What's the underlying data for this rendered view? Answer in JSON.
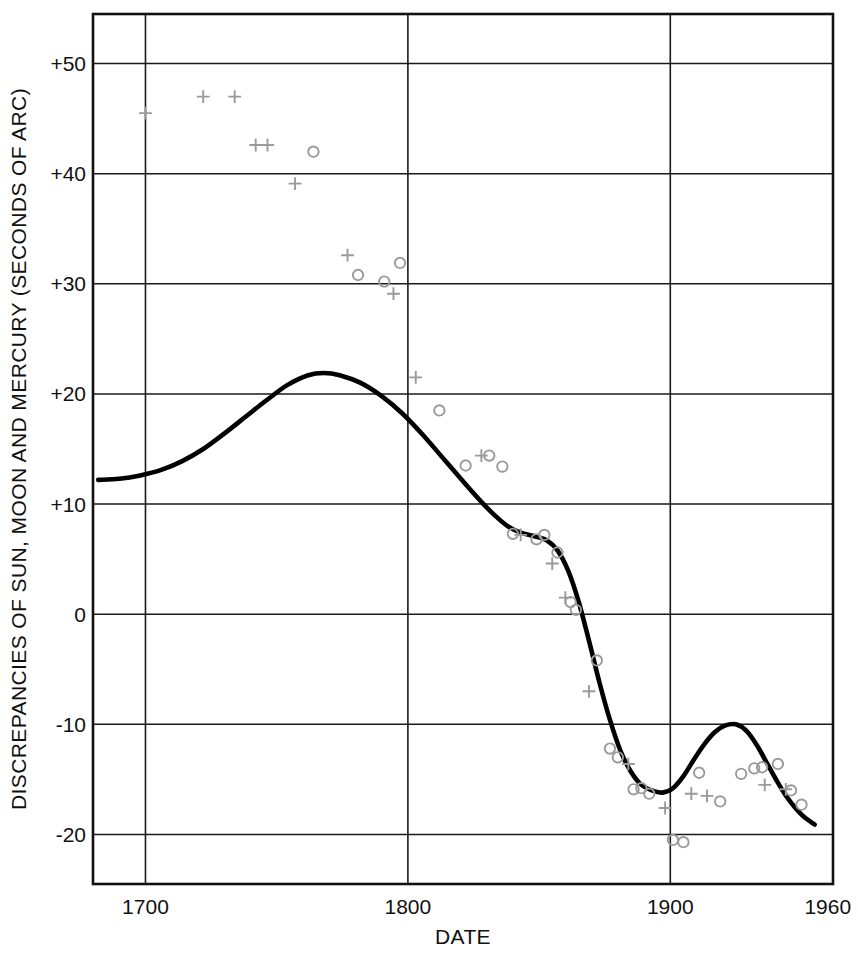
{
  "chart_data": {
    "type": "scatter",
    "title": "",
    "xlabel": "DATE",
    "ylabel": "DISCREPANCIES OF SUN, MOON AND MERCURY (SECONDS OF ARC)",
    "xlim": [
      1680,
      1962
    ],
    "ylim": [
      -24.5,
      54.5
    ],
    "xticks": [
      1700,
      1800,
      1900,
      1960
    ],
    "xticklabels": [
      "1700",
      "1800",
      "1900",
      "1960"
    ],
    "yticks": [
      50,
      40,
      30,
      20,
      10,
      0,
      -10,
      -20
    ],
    "yticklabels": [
      "+50",
      "+40",
      "+30",
      "+20",
      "+10",
      "0",
      "-10",
      "-20"
    ],
    "grid": true,
    "gridlines_x": [
      1700,
      1800,
      1900
    ],
    "gridlines_y": [
      50,
      40,
      30,
      20,
      10,
      0,
      -10,
      -20
    ],
    "legend": "none",
    "marker_color": "#9a9a9a",
    "curve_color": "#000000",
    "series": [
      {
        "name": "plus-markers",
        "marker": "plus",
        "points": [
          [
            1700.0,
            45.5
          ],
          [
            1722.0,
            47.0
          ],
          [
            1734.0,
            47.0
          ],
          [
            1742.0,
            42.6
          ],
          [
            1746.5,
            42.6
          ],
          [
            1757.0,
            39.1
          ],
          [
            1777.0,
            32.6
          ],
          [
            1794.5,
            29.1
          ],
          [
            1803.0,
            21.5
          ],
          [
            1828.0,
            14.4
          ],
          [
            1843.0,
            7.2
          ],
          [
            1855.0,
            4.6
          ],
          [
            1860.0,
            1.5
          ],
          [
            1869.0,
            -7.0
          ],
          [
            1884.0,
            -13.6
          ],
          [
            1898.0,
            -17.6
          ],
          [
            1908.0,
            -16.3
          ],
          [
            1914.0,
            -16.5
          ],
          [
            1936.0,
            -15.5
          ],
          [
            1944.0,
            -15.9
          ]
        ]
      },
      {
        "name": "circle-markers",
        "marker": "circle",
        "points": [
          [
            1764.0,
            42.0
          ],
          [
            1781.0,
            30.8
          ],
          [
            1791.0,
            30.2
          ],
          [
            1797.0,
            31.9
          ],
          [
            1812.0,
            18.5
          ],
          [
            1822.0,
            13.5
          ],
          [
            1831.0,
            14.4
          ],
          [
            1836.0,
            13.4
          ],
          [
            1840.0,
            7.3
          ],
          [
            1849.0,
            6.8
          ],
          [
            1852.0,
            7.2
          ],
          [
            1857.0,
            5.6
          ],
          [
            1862.0,
            1.1
          ],
          [
            1864.0,
            0.4
          ],
          [
            1872.0,
            -4.2
          ],
          [
            1877.0,
            -12.2
          ],
          [
            1880.0,
            -13.0
          ],
          [
            1886.0,
            -15.9
          ],
          [
            1889.0,
            -15.8
          ],
          [
            1892.0,
            -16.3
          ],
          [
            1901.0,
            -20.5
          ],
          [
            1905.0,
            -20.7
          ],
          [
            1911.0,
            -14.4
          ],
          [
            1919.0,
            -17.0
          ],
          [
            1927.0,
            -14.5
          ],
          [
            1932.0,
            -14.0
          ],
          [
            1935.0,
            -13.9
          ],
          [
            1941.0,
            -13.6
          ],
          [
            1946.0,
            -16.0
          ],
          [
            1950.0,
            -17.3
          ]
        ]
      }
    ],
    "fitted_curve": {
      "name": "smoothed-trend-curve",
      "points": [
        [
          1682,
          12.2
        ],
        [
          1690,
          12.3
        ],
        [
          1698,
          12.6
        ],
        [
          1706,
          13.1
        ],
        [
          1714,
          13.9
        ],
        [
          1722,
          15.0
        ],
        [
          1730,
          16.4
        ],
        [
          1738,
          17.9
        ],
        [
          1746,
          19.4
        ],
        [
          1754,
          20.8
        ],
        [
          1762,
          21.7
        ],
        [
          1768,
          21.9
        ],
        [
          1774,
          21.7
        ],
        [
          1782,
          21.0
        ],
        [
          1790,
          19.8
        ],
        [
          1798,
          18.2
        ],
        [
          1806,
          16.2
        ],
        [
          1814,
          14.0
        ],
        [
          1822,
          11.8
        ],
        [
          1828,
          10.2
        ],
        [
          1833,
          9.0
        ],
        [
          1838,
          8.0
        ],
        [
          1843,
          7.4
        ],
        [
          1848,
          7.1
        ],
        [
          1853,
          6.7
        ],
        [
          1857,
          5.8
        ],
        [
          1861,
          4.0
        ],
        [
          1865,
          1.2
        ],
        [
          1869,
          -2.4
        ],
        [
          1873,
          -6.2
        ],
        [
          1877,
          -9.6
        ],
        [
          1881,
          -12.4
        ],
        [
          1885,
          -14.3
        ],
        [
          1889,
          -15.5
        ],
        [
          1893,
          -16.0
        ],
        [
          1897,
          -16.2
        ],
        [
          1901,
          -15.8
        ],
        [
          1905,
          -14.7
        ],
        [
          1909,
          -13.2
        ],
        [
          1913,
          -11.8
        ],
        [
          1917,
          -10.7
        ],
        [
          1921,
          -10.1
        ],
        [
          1925,
          -10.0
        ],
        [
          1929,
          -10.6
        ],
        [
          1933,
          -11.9
        ],
        [
          1937,
          -13.6
        ],
        [
          1941,
          -15.3
        ],
        [
          1945,
          -16.8
        ],
        [
          1950,
          -18.2
        ],
        [
          1955,
          -19.1
        ]
      ]
    }
  }
}
